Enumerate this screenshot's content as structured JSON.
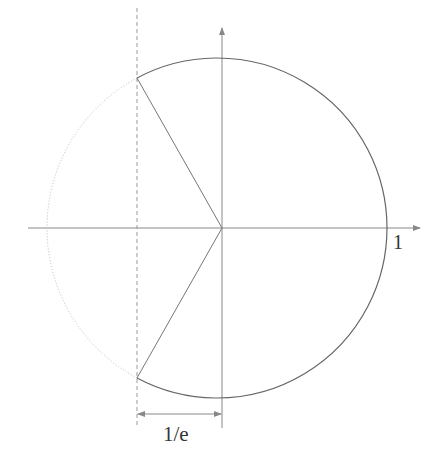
{
  "diagram": {
    "labels": {
      "one": "1",
      "inv_e": "1/e"
    },
    "colors": {
      "solid_arc": "#666666",
      "dotted_arc": "#bbbbbb",
      "axes": "#888888",
      "dashed_line": "#999999"
    }
  }
}
